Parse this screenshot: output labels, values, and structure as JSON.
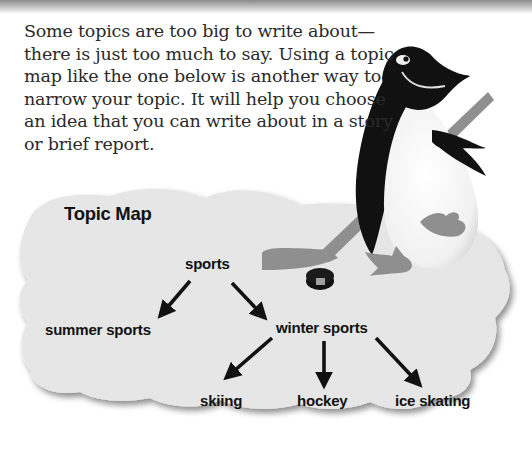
{
  "intro": {
    "lines": [
      "Some topics are too big to write about—",
      "there is just too much to say. Using a topic",
      "map like the one below is another way to",
      "narrow your topic. It will help you choose",
      "an idea that you can write about in a story",
      "or brief report."
    ]
  },
  "topic_map": {
    "title": "Topic Map",
    "nodes": {
      "root": "sports",
      "summer": "summer sports",
      "winter": "winter sports",
      "skiing": "skiing",
      "hockey": "hockey",
      "ice_skating": "ice skating"
    },
    "edges": [
      [
        "sports",
        "summer sports"
      ],
      [
        "sports",
        "winter sports"
      ],
      [
        "winter sports",
        "skiing"
      ],
      [
        "winter sports",
        "hockey"
      ],
      [
        "winter sports",
        "ice skating"
      ]
    ]
  },
  "illustration": {
    "subject": "penguin-playing-hockey",
    "elements": [
      "penguin",
      "hockey-stick",
      "puck"
    ]
  },
  "colors": {
    "cloud": "#e6e6e6",
    "cloud_shadow": "#b8b8b8",
    "text": "#2a2a2a",
    "arrows": "#111111",
    "penguin_black": "#111111",
    "stick_gray": "#8f8f8f"
  }
}
